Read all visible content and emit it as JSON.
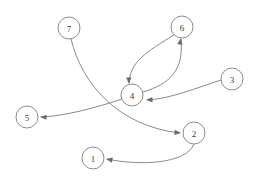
{
  "diagram": {
    "type": "directed-graph",
    "background_color": "#ffffff",
    "node_stroke_color": "#8c8c8c",
    "node_fill_color": "#ffffff",
    "edge_color": "#7d7d7d",
    "label_color": "#3a3a3a",
    "node_radius": 11,
    "nodes": [
      {
        "id": "1",
        "label": "1",
        "cx": 93,
        "cy": 158
      },
      {
        "id": "2",
        "label": "2",
        "cx": 194,
        "cy": 133
      },
      {
        "id": "3",
        "label": "3",
        "cx": 232,
        "cy": 79
      },
      {
        "id": "4",
        "label": "4",
        "cx": 132,
        "cy": 95
      },
      {
        "id": "5",
        "label": "5",
        "cx": 27,
        "cy": 117
      },
      {
        "id": "6",
        "label": "6",
        "cx": 182,
        "cy": 27
      },
      {
        "id": "7",
        "label": "7",
        "cx": 69,
        "cy": 28
      }
    ],
    "edges": [
      {
        "id": "e-6-4",
        "from": "6",
        "to": "4",
        "path": "M 174 35 C 146 52 130 62 129 83"
      },
      {
        "id": "e-4-6",
        "from": "4",
        "to": "6",
        "path": "M 143 92 C 170 84 184 70 181 39"
      },
      {
        "id": "e-3-4",
        "from": "3",
        "to": "4",
        "path": "M 221 80 C 196 88 170 99 147 100"
      },
      {
        "id": "e-4-5",
        "from": "4",
        "to": "5",
        "path": "M 122 99 C 95 108 65 116 41 117"
      },
      {
        "id": "e-7-2",
        "from": "7",
        "to": "2",
        "path": "M 71 39 C 82 84 118 126 180 133"
      },
      {
        "id": "e-2-1",
        "from": "2",
        "to": "1",
        "path": "M 194 144 C 186 164 140 166 107 159"
      }
    ],
    "arrow_heads": [
      {
        "id": "a-6-4",
        "edge": "e-6-4",
        "x": 129,
        "y": 84,
        "angle": 88
      },
      {
        "id": "a-4-6",
        "edge": "e-4-6",
        "x": 181,
        "y": 38,
        "angle": -79
      },
      {
        "id": "a-3-4",
        "edge": "e-3-4",
        "x": 146,
        "y": 100,
        "angle": 177
      },
      {
        "id": "a-4-5",
        "edge": "e-4-5",
        "x": 40,
        "y": 117,
        "angle": 182
      },
      {
        "id": "a-7-2",
        "edge": "e-7-2",
        "x": 181,
        "y": 133,
        "angle": 6
      },
      {
        "id": "a-2-1",
        "edge": "e-2-1",
        "x": 106,
        "y": 159,
        "angle": 190
      }
    ]
  }
}
